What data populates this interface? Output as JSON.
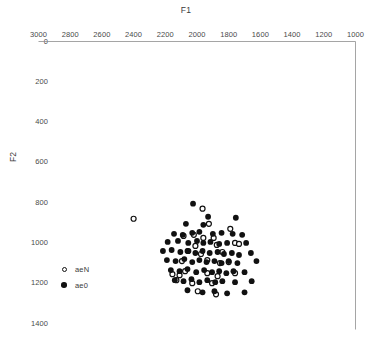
{
  "chart_data": {
    "type": "scatter",
    "title": "F1",
    "xlabel": "F1",
    "ylabel": "F2",
    "xlim": [
      3000,
      1000
    ],
    "ylim": [
      1400,
      0
    ],
    "x_axis_position": "top",
    "y_axis_position": "left",
    "x_reversed": true,
    "y_reversed": true,
    "grid": false,
    "legend_position": "left-lower",
    "xticks": [
      3000,
      2800,
      2600,
      2400,
      2200,
      2000,
      1800,
      1600,
      1400,
      1200,
      1000
    ],
    "yticks": [
      0,
      200,
      400,
      600,
      800,
      1000,
      1200,
      1400
    ],
    "xtick_labels": [
      "3000",
      "2800",
      "2600",
      "2400",
      "2200",
      "2000",
      "1800",
      "1600",
      "1400",
      "1200",
      "1000"
    ],
    "ytick_labels": [
      "0",
      "200",
      "400",
      "600",
      "800",
      "1000",
      "1200",
      "1400"
    ],
    "series": [
      {
        "name": "aeN",
        "marker": "open-circle",
        "color": "#111111",
        "points": [
          [
            2400,
            880
          ],
          [
            1965,
            830
          ],
          [
            1925,
            905
          ],
          [
            1790,
            930
          ],
          [
            2085,
            965
          ],
          [
            2020,
            960
          ],
          [
            1960,
            975
          ],
          [
            1895,
            975
          ],
          [
            2010,
            1015
          ],
          [
            1875,
            1010
          ],
          [
            1760,
            1000
          ],
          [
            1735,
            1005
          ],
          [
            2055,
            1040
          ],
          [
            1975,
            1055
          ],
          [
            1840,
            1045
          ],
          [
            2095,
            1090
          ],
          [
            1935,
            1085
          ],
          [
            1855,
            1100
          ],
          [
            1800,
            1095
          ],
          [
            2155,
            1155
          ],
          [
            2110,
            1160
          ],
          [
            2075,
            1140
          ],
          [
            1935,
            1150
          ],
          [
            1870,
            1165
          ],
          [
            1760,
            1150
          ],
          [
            2130,
            1185
          ],
          [
            2030,
            1200
          ],
          [
            1905,
            1200
          ],
          [
            1995,
            1240
          ],
          [
            1880,
            1255
          ]
        ]
      },
      {
        "name": "ae0",
        "marker": "filled-circle",
        "color": "#111111",
        "points": [
          [
            2025,
            805
          ],
          [
            1930,
            870
          ],
          [
            1755,
            875
          ],
          [
            2070,
            905
          ],
          [
            1960,
            910
          ],
          [
            2145,
            955
          ],
          [
            2090,
            960
          ],
          [
            2030,
            950
          ],
          [
            1985,
            945
          ],
          [
            1900,
            955
          ],
          [
            1845,
            950
          ],
          [
            1775,
            955
          ],
          [
            1715,
            960
          ],
          [
            2185,
            995
          ],
          [
            2120,
            990
          ],
          [
            2055,
            1000
          ],
          [
            2000,
            990
          ],
          [
            1960,
            1000
          ],
          [
            1915,
            995
          ],
          [
            1860,
            1005
          ],
          [
            1810,
            1000
          ],
          [
            1690,
            1000
          ],
          [
            2215,
            1040
          ],
          [
            2160,
            1035
          ],
          [
            2105,
            1045
          ],
          [
            2060,
            1040
          ],
          [
            2010,
            1050
          ],
          [
            1965,
            1040
          ],
          [
            1920,
            1050
          ],
          [
            1870,
            1045
          ],
          [
            1830,
            1055
          ],
          [
            1780,
            1050
          ],
          [
            1735,
            1060
          ],
          [
            1660,
            1050
          ],
          [
            2190,
            1085
          ],
          [
            2135,
            1090
          ],
          [
            2080,
            1080
          ],
          [
            2030,
            1095
          ],
          [
            1985,
            1085
          ],
          [
            1940,
            1095
          ],
          [
            1890,
            1090
          ],
          [
            1845,
            1100
          ],
          [
            1800,
            1090
          ],
          [
            1745,
            1100
          ],
          [
            1625,
            1090
          ],
          [
            2165,
            1135
          ],
          [
            2110,
            1140
          ],
          [
            2060,
            1130
          ],
          [
            2005,
            1145
          ],
          [
            1955,
            1135
          ],
          [
            1905,
            1145
          ],
          [
            1860,
            1140
          ],
          [
            1815,
            1150
          ],
          [
            1770,
            1140
          ],
          [
            1700,
            1145
          ],
          [
            2140,
            1185
          ],
          [
            2085,
            1190
          ],
          [
            2035,
            1180
          ],
          [
            1985,
            1195
          ],
          [
            1935,
            1185
          ],
          [
            1885,
            1195
          ],
          [
            1840,
            1190
          ],
          [
            1760,
            1195
          ],
          [
            1655,
            1190
          ],
          [
            2060,
            1235
          ],
          [
            1965,
            1245
          ],
          [
            1890,
            1240
          ],
          [
            1810,
            1250
          ],
          [
            1700,
            1245
          ]
        ]
      }
    ]
  }
}
